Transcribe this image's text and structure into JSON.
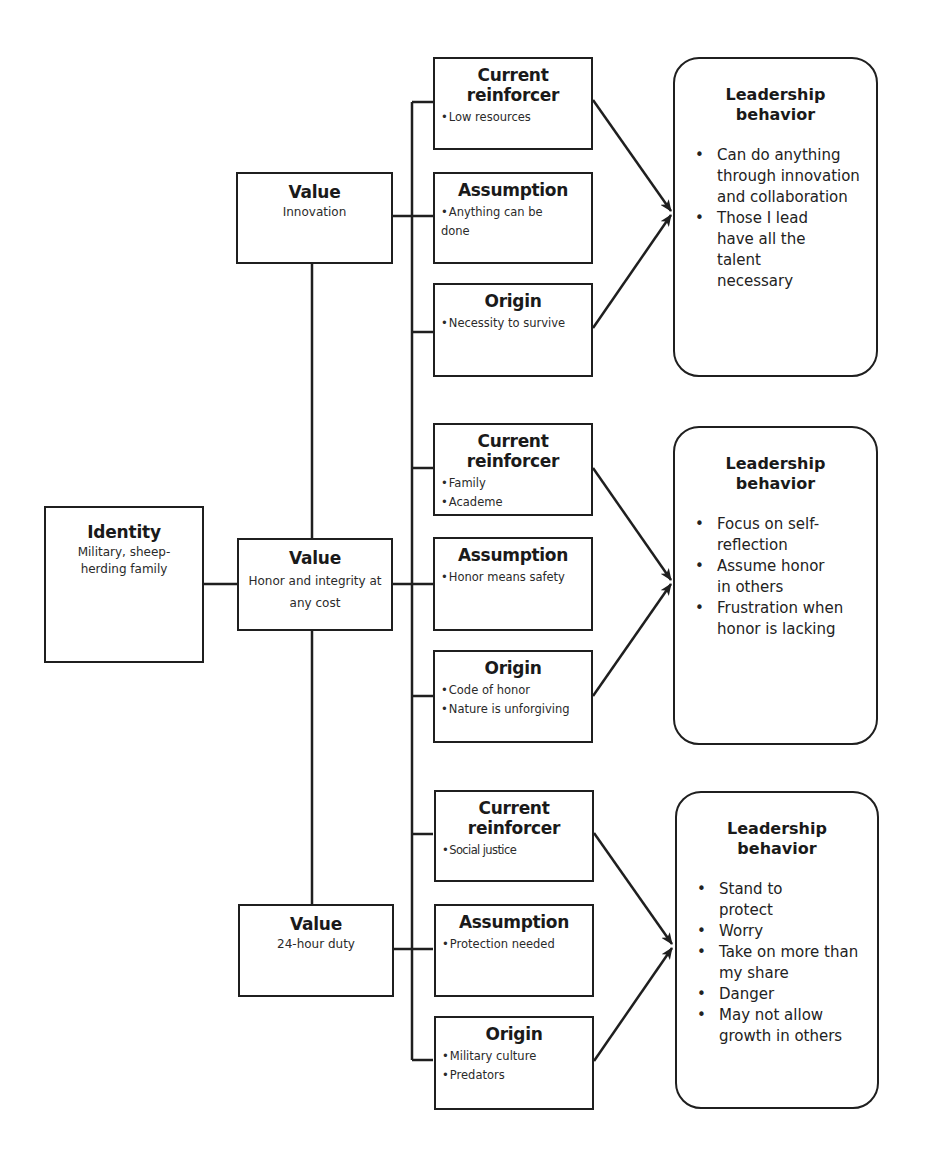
{
  "identity": {
    "title": "Identity",
    "text": "Military, sheep-herding family"
  },
  "groups": [
    {
      "value": {
        "title": "Value",
        "text": "Innovation"
      },
      "current_reinforcer": {
        "title": "Current reinforcer",
        "items": [
          "Low resources"
        ]
      },
      "assumption": {
        "title": "Assumption",
        "items": [
          "Anything can be done"
        ]
      },
      "origin": {
        "title": "Origin",
        "items": [
          "Necessity to survive"
        ]
      },
      "leadership": {
        "title": "Leadership behavior",
        "items": [
          "Can do anything through innovation and collaboration",
          "Those I lead have all the talent necessary"
        ]
      }
    },
    {
      "value": {
        "title": "Value",
        "text": "Honor and integrity at any cost"
      },
      "current_reinforcer": {
        "title": "Current reinforcer",
        "items": [
          "Family",
          "Academe"
        ]
      },
      "assumption": {
        "title": "Assumption",
        "items": [
          "Honor means safety"
        ]
      },
      "origin": {
        "title": "Origin",
        "items": [
          "Code of honor",
          "Nature is unforgiving"
        ]
      },
      "leadership": {
        "title": "Leadership behavior",
        "items": [
          "Focus on self-reflection",
          "Assume honor in others",
          "Frustration when honor is lacking"
        ]
      }
    },
    {
      "value": {
        "title": "Value",
        "text": "24-hour duty"
      },
      "current_reinforcer": {
        "title": "Current reinforcer",
        "items": [
          "Social justice"
        ]
      },
      "assumption": {
        "title": "Assumption",
        "items": [
          "Protection needed"
        ]
      },
      "origin": {
        "title": "Origin",
        "items": [
          "Military culture",
          "Predators"
        ]
      },
      "leadership": {
        "title": "Leadership behavior",
        "items": [
          "Stand to protect",
          "Worry",
          "Take on more than my share",
          "Danger",
          "May not allow growth in others"
        ]
      }
    }
  ],
  "colors": {
    "stroke": "#1f1f1f",
    "background": "#ffffff"
  }
}
